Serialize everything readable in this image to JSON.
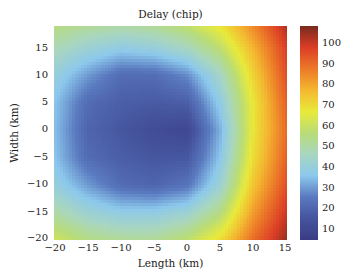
{
  "chart_data": {
    "type": "heatmap",
    "title": "Delay (chip)",
    "xlabel": "Length (km)",
    "ylabel": "Width (km)",
    "xlim": [
      -20,
      15
    ],
    "ylim": [
      -20,
      19
    ],
    "x_ticks": [
      -20,
      -15,
      -10,
      -5,
      0,
      5,
      10,
      15
    ],
    "y_ticks": [
      -20,
      -15,
      -10,
      -5,
      0,
      5,
      10,
      15
    ],
    "colorbar": {
      "label": "Delay (chip)",
      "range": [
        5,
        108
      ],
      "ticks": [
        10,
        20,
        30,
        40,
        50,
        60,
        70,
        80,
        90,
        100
      ],
      "colors": [
        "#3a3d85",
        "#45549e",
        "#5a7ac0",
        "#8cc8ec",
        "#a8d6c0",
        "#b8dc78",
        "#e8ea3a",
        "#f4b830",
        "#ec7a28",
        "#dc3e26",
        "#7a2a1e"
      ]
    },
    "grid": {
      "x": [
        -20,
        -15,
        -10,
        -5,
        0,
        5,
        10,
        15
      ],
      "y": [
        19,
        15,
        10,
        5,
        0,
        -5,
        -10,
        -15,
        -20
      ],
      "values": [
        [
          55,
          52,
          50,
          52,
          58,
          68,
          85,
          103
        ],
        [
          48,
          42,
          38,
          40,
          46,
          58,
          78,
          98
        ],
        [
          40,
          30,
          22,
          22,
          28,
          45,
          72,
          95
        ],
        [
          36,
          22,
          18,
          17,
          18,
          38,
          68,
          92
        ],
        [
          35,
          20,
          16,
          12,
          10,
          33,
          68,
          90
        ],
        [
          36,
          22,
          18,
          16,
          16,
          36,
          70,
          92
        ],
        [
          40,
          30,
          22,
          20,
          24,
          42,
          75,
          95
        ],
        [
          50,
          42,
          38,
          38,
          42,
          55,
          82,
          100
        ],
        [
          62,
          55,
          52,
          52,
          58,
          70,
          90,
          105
        ]
      ]
    },
    "grid_on": false
  },
  "labels": {
    "title": "Delay (chip)",
    "xlabel": "Length (km)",
    "ylabel": "Width (km)",
    "xticks": [
      "−20",
      "−15",
      "−10",
      "−5",
      "0",
      "5",
      "10",
      "15"
    ],
    "yticks": [
      "15",
      "10",
      "5",
      "0",
      "−5",
      "−10",
      "−15",
      "−20"
    ],
    "cticks": [
      "100",
      "90",
      "80",
      "70",
      "60",
      "50",
      "40",
      "30",
      "20",
      "10"
    ]
  }
}
